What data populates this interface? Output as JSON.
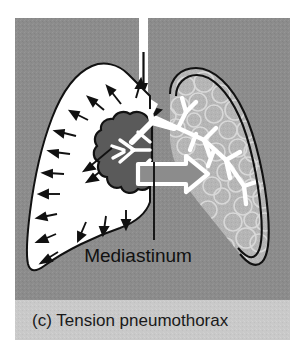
{
  "figure": {
    "kind": "medical-illustration",
    "panel_letter": "(c)",
    "caption": "(c) Tension pneumothorax",
    "caption_band_color": "#c9c9c9",
    "background_color": "#8c8c8c",
    "page_color": "#ffffff"
  },
  "annotations": {
    "mediastinum_label": "Mediastinum"
  },
  "structures": {
    "trachea": {
      "name": "trachea",
      "color": "#ffffff",
      "airflow_arrow": "downward"
    },
    "pleural_air_space": {
      "name": "pleural-air-space",
      "side": "left-of-image",
      "color": "#ffffff",
      "pressure_arrows": 16,
      "arrow_color": "#111111",
      "arrow_direction": "outward"
    },
    "collapsed_lung": {
      "name": "collapsed-lung",
      "side": "left-of-image",
      "fill_color": "#5a5a5a",
      "outline_color": "#111111"
    },
    "intact_lung": {
      "name": "intact-lung",
      "side": "right-of-image",
      "fill_color": "#b5b5b5",
      "alveoli_texture": true,
      "pleura_outline_color": "#111111",
      "bronchi_color": "#ffffff"
    },
    "mediastinal_shift_arrow": {
      "name": "mediastinal-shift-arrow",
      "direction": "right",
      "outline_color": "#ffffff",
      "fill_color": "#8c8c8c"
    }
  },
  "colors": {
    "background": "#8c8c8c",
    "caption_band": "#c9c9c9",
    "air_white": "#ffffff",
    "lung_gray": "#b5b5b5",
    "collapsed_gray": "#5a5a5a",
    "ink": "#111111"
  }
}
